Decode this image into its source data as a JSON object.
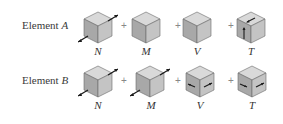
{
  "rows": [
    {
      "label_prefix": "Element ",
      "label_var": "A",
      "components": [
        {
          "symbol": "N",
          "arrows": "axial"
        },
        {
          "symbol": "M",
          "arrows": "none"
        },
        {
          "symbol": "V",
          "arrows": "none"
        },
        {
          "symbol": "T",
          "arrows": "shear-front"
        }
      ]
    },
    {
      "label_prefix": "Element ",
      "label_var": "B",
      "components": [
        {
          "symbol": "N",
          "arrows": "axial"
        },
        {
          "symbol": "M",
          "arrows": "axial"
        },
        {
          "symbol": "V",
          "arrows": "horizontal-front"
        },
        {
          "symbol": "T",
          "arrows": "horizontal-front"
        }
      ]
    }
  ],
  "operator": "+",
  "colors": {
    "top_face": "#d9d9d9",
    "left_face": "#a8a8a8",
    "right_face": "#c4c4c4",
    "edge": "#6a6a6a",
    "arrow": "#1a1a1a"
  }
}
